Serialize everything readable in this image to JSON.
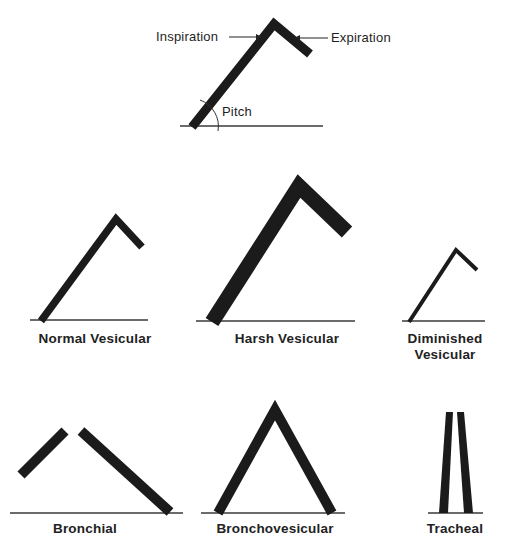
{
  "figure": {
    "type": "breath-sound-diagram",
    "legend": {
      "inspiration_label": "Inspiration",
      "expiration_label": "Expiration",
      "pitch_label": "Pitch"
    },
    "sounds": [
      {
        "name": "Normal Vesicular",
        "caption": "Normal Vesicular"
      },
      {
        "name": "Harsh Vesicular",
        "caption": "Harsh Vesicular"
      },
      {
        "name": "Diminished Vesicular",
        "caption_line1": "Diminished",
        "caption_line2": "Vesicular"
      },
      {
        "name": "Bronchial",
        "caption": "Bronchial"
      },
      {
        "name": "Bronchovesicular",
        "caption": "Bronchovesicular"
      },
      {
        "name": "Tracheal",
        "caption": "Tracheal"
      }
    ],
    "colors": {
      "stroke": "#1b1b1b",
      "baseline": "#3a3a3a",
      "background": "#ffffff"
    }
  }
}
